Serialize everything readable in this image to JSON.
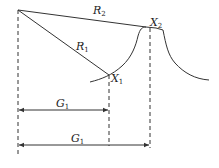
{
  "diagram": {
    "type": "geometric-distance-diagram",
    "stroke_color": "#333333",
    "labels": {
      "R2": {
        "base": "R",
        "sub": "2"
      },
      "R1": {
        "base": "R",
        "sub": "1"
      },
      "X2": {
        "base": "X",
        "sub": "2"
      },
      "X1": {
        "base": "X",
        "sub": "1"
      },
      "G_upper": {
        "base": "G",
        "sub": "1"
      },
      "G_lower": {
        "base": "G",
        "sub": "1"
      }
    },
    "points": {
      "origin": [
        18,
        10
      ],
      "X1": [
        109,
        75
      ],
      "X2": [
        146,
        27
      ]
    },
    "dimension_lines": [
      {
        "label": "G_upper",
        "from_x": 18,
        "to_x": 109,
        "y": 110
      },
      {
        "label": "G_lower",
        "from_x": 18,
        "to_x": 150,
        "y": 145
      }
    ]
  }
}
